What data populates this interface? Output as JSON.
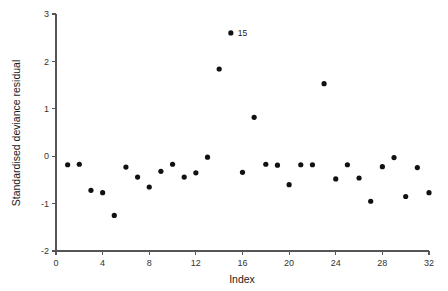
{
  "chart_data": {
    "type": "scatter",
    "title": "",
    "xlabel": "Index",
    "ylabel": "Standardised deviance residual",
    "xlim": [
      0,
      32
    ],
    "ylim": [
      -2,
      3
    ],
    "xticks": [
      0,
      4,
      8,
      12,
      16,
      20,
      24,
      28,
      32
    ],
    "xtick_labels": [
      "0",
      "4",
      "8",
      "12",
      "16",
      "20",
      "24",
      "28",
      "32"
    ],
    "yticks": [
      -2,
      -1,
      0,
      1,
      2,
      3
    ],
    "ytick_labels": [
      "-2",
      "-1",
      "0",
      "1",
      "2",
      "3"
    ],
    "grid": false,
    "legend": null,
    "marker": "filled-circle",
    "marker_color": "#111111",
    "x": [
      1,
      2,
      3,
      4,
      5,
      6,
      7,
      8,
      9,
      10,
      11,
      12,
      13,
      14,
      15,
      16,
      17,
      18,
      19,
      20,
      21,
      22,
      23,
      24,
      25,
      26,
      27,
      28,
      29,
      30,
      31,
      32
    ],
    "y": [
      -0.18,
      -0.17,
      -0.72,
      -0.77,
      -1.25,
      -0.23,
      -0.44,
      -0.65,
      -0.32,
      -0.17,
      -0.44,
      -0.35,
      -0.02,
      1.84,
      2.6,
      -0.34,
      0.82,
      -0.17,
      -0.19,
      -0.6,
      -0.18,
      -0.18,
      1.53,
      -0.48,
      -0.18,
      -0.46,
      -0.95,
      -0.22,
      -0.03,
      -0.85,
      -0.24,
      -0.77
    ],
    "annotations": [
      {
        "label": "15",
        "x": 15,
        "y": 2.6,
        "dx": 7,
        "dy": 3
      }
    ]
  },
  "figure": {
    "background_color": "#ffffff",
    "axis_color": "#555555",
    "text_color": "#1a1a1a"
  }
}
